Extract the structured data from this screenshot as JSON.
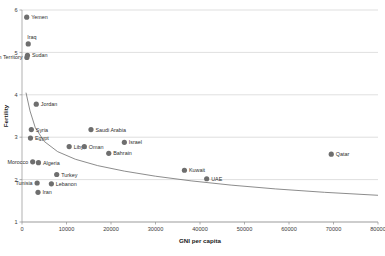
{
  "chart_data": {
    "type": "scatter",
    "title": "",
    "xlabel": "GNI per capita",
    "ylabel": "Fertility",
    "xlim": [
      0,
      80000
    ],
    "ylim": [
      1,
      6
    ],
    "xticks": [
      0,
      10000,
      20000,
      30000,
      40000,
      50000,
      60000,
      70000,
      80000
    ],
    "xticklabels": [
      "0",
      "10000",
      "20000",
      "30000",
      "40000",
      "50000",
      "60000",
      "70000",
      "80000"
    ],
    "yticks": [
      1,
      2,
      3,
      4,
      5,
      6
    ],
    "yticklabels": [
      "1",
      "2",
      "3",
      "4",
      "5",
      "6"
    ],
    "grid": "horizontal",
    "legend": "none",
    "marker_color": "#6e6e6e",
    "trend_color": "#6f6f6f",
    "points": [
      {
        "label": "Yemen",
        "x": 1060,
        "y": 5.83,
        "label_pos": "right"
      },
      {
        "label": "Iraq",
        "x": 1400,
        "y": 5.2,
        "label_pos": "above"
      },
      {
        "label": "Sudan",
        "x": 1230,
        "y": 4.93,
        "label_pos": "right"
      },
      {
        "label": "Palestinian Territory",
        "x": 1100,
        "y": 4.88,
        "label_pos": "left"
      },
      {
        "label": "Jordan",
        "x": 3200,
        "y": 3.78,
        "label_pos": "right"
      },
      {
        "label": "Syria",
        "x": 2100,
        "y": 3.18,
        "label_pos": "right"
      },
      {
        "label": "Saudi Arabia",
        "x": 15500,
        "y": 3.18,
        "label_pos": "right"
      },
      {
        "label": "Egypt",
        "x": 1900,
        "y": 2.98,
        "label_pos": "right"
      },
      {
        "label": "Libya",
        "x": 10600,
        "y": 2.78,
        "label_pos": "right"
      },
      {
        "label": "Oman",
        "x": 14000,
        "y": 2.78,
        "label_pos": "right"
      },
      {
        "label": "Israel",
        "x": 23000,
        "y": 2.88,
        "label_pos": "right"
      },
      {
        "label": "Bahrain",
        "x": 19500,
        "y": 2.62,
        "label_pos": "right"
      },
      {
        "label": "Qatar",
        "x": 69500,
        "y": 2.6,
        "label_pos": "right"
      },
      {
        "label": "Morocco",
        "x": 2400,
        "y": 2.42,
        "label_pos": "left"
      },
      {
        "label": "Algeria",
        "x": 3700,
        "y": 2.4,
        "label_pos": "right"
      },
      {
        "label": "Kuwait",
        "x": 36500,
        "y": 2.22,
        "label_pos": "right"
      },
      {
        "label": "UAE",
        "x": 41500,
        "y": 2.02,
        "label_pos": "right"
      },
      {
        "label": "Turkey",
        "x": 7800,
        "y": 2.12,
        "label_pos": "right"
      },
      {
        "label": "Tunisia",
        "x": 3400,
        "y": 1.92,
        "label_pos": "left"
      },
      {
        "label": "Lebanon",
        "x": 6600,
        "y": 1.9,
        "label_pos": "right"
      },
      {
        "label": "Iran",
        "x": 3600,
        "y": 1.7,
        "label_pos": "right"
      }
    ],
    "trend_curve": [
      {
        "x": 900,
        "y": 4.05
      },
      {
        "x": 1800,
        "y": 3.62
      },
      {
        "x": 3000,
        "y": 3.22
      },
      {
        "x": 5000,
        "y": 2.9
      },
      {
        "x": 8000,
        "y": 2.66
      },
      {
        "x": 12000,
        "y": 2.48
      },
      {
        "x": 17000,
        "y": 2.33
      },
      {
        "x": 23000,
        "y": 2.2
      },
      {
        "x": 30000,
        "y": 2.08
      },
      {
        "x": 38000,
        "y": 1.97
      },
      {
        "x": 47000,
        "y": 1.87
      },
      {
        "x": 57000,
        "y": 1.78
      },
      {
        "x": 68000,
        "y": 1.7
      },
      {
        "x": 80000,
        "y": 1.63
      }
    ]
  }
}
